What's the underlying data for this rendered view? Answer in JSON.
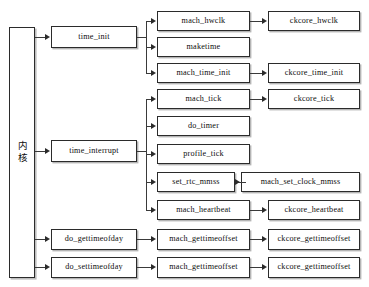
{
  "figure": {
    "caption_fragment": "",
    "kernel_label": "内核"
  },
  "nodes": {
    "kernel": "内核",
    "time_init": "time_init",
    "time_interrupt": "time_interrupt",
    "do_gettimeofday": "do_gettimeofday",
    "do_settimeofday": "do_settimeofday",
    "mach_hwclk": "mach_hwclk",
    "maketime": "maketime",
    "mach_time_init": "mach_time_init",
    "mach_tick": "mach_tick",
    "do_timer": "do_timer",
    "profile_tick": "profile_tick",
    "set_rtc_mmss": "set_rtc_mmss",
    "mach_heartbeat": "mach_heartbeat",
    "mach_gettimeoffset_1": "mach_gettimeoffset",
    "mach_gettimeoffset_2": "mach_gettimeoffset",
    "ckcore_hwclk": "ckcore_hwclk",
    "ckcore_time_init": "ckcore_time_init",
    "ckcore_tick": "ckcore_tick",
    "mach_set_clock_mmss": "mach_set_clock_mmss",
    "ckcore_heartbeat": "ckcore_heartbeat",
    "ckcore_gettimeoffset_1": "ckcore_gettimeoffset",
    "ckcore_gettimeoffset_2": "ckcore_gettimeoffset"
  },
  "colors": {
    "box_border": "#2b2b2b",
    "line": "#3a3a3a",
    "background": "#ffffff",
    "text": "#0d0d0d"
  }
}
